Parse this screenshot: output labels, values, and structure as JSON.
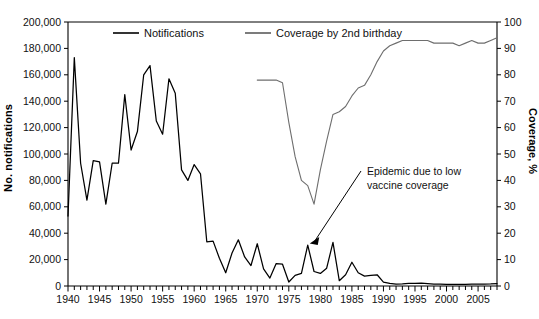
{
  "chart_data": {
    "type": "line",
    "title": "",
    "xlabel": "",
    "ylabel": "No. notifications",
    "y2label": "Coverage, %",
    "xlim": [
      1940,
      2008
    ],
    "ylim": [
      0,
      200000
    ],
    "y2lim": [
      0,
      100
    ],
    "grid": false,
    "legend_position": "top-center",
    "xticks": [
      1940,
      1945,
      1950,
      1955,
      1960,
      1965,
      1970,
      1975,
      1980,
      1985,
      1990,
      1995,
      2000,
      2005
    ],
    "xticklabels": [
      "1940",
      "1945",
      "1950",
      "1955",
      "1960",
      "1965",
      "1970",
      "1975",
      "1980",
      "1985",
      "1990",
      "1995",
      "2000",
      "2005"
    ],
    "yticks": [
      0,
      20000,
      40000,
      60000,
      80000,
      100000,
      120000,
      140000,
      160000,
      180000,
      200000
    ],
    "yticklabels": [
      "0",
      "20,000",
      "40,000",
      "60,000",
      "80,000",
      "100,000",
      "120,000",
      "140,000",
      "160,000",
      "180,000",
      "200,000"
    ],
    "y2ticks": [
      0,
      10,
      20,
      30,
      40,
      50,
      60,
      70,
      80,
      90,
      100
    ],
    "y2ticklabels": [
      "0",
      "10",
      "20",
      "30",
      "40",
      "50",
      "60",
      "70",
      "80",
      "90",
      "100"
    ],
    "minor_xticks_interval": 1,
    "series": [
      {
        "name": "Notifications",
        "axis": "left",
        "color": "#000000",
        "x": [
          1940,
          1941,
          1942,
          1943,
          1944,
          1945,
          1946,
          1947,
          1948,
          1949,
          1950,
          1951,
          1952,
          1953,
          1954,
          1955,
          1956,
          1957,
          1958,
          1959,
          1960,
          1961,
          1962,
          1963,
          1964,
          1965,
          1966,
          1967,
          1968,
          1969,
          1970,
          1971,
          1972,
          1973,
          1974,
          1975,
          1976,
          1977,
          1978,
          1979,
          1980,
          1981,
          1982,
          1983,
          1984,
          1985,
          1986,
          1987,
          1988,
          1989,
          1990,
          1991,
          1992,
          1993,
          1994,
          1995,
          1996,
          1997,
          1998,
          1999,
          2000,
          2001,
          2002,
          2003,
          2004,
          2005,
          2006,
          2007,
          2008
        ],
        "values": [
          53000,
          173000,
          93000,
          65000,
          95000,
          94000,
          62000,
          93000,
          93000,
          145000,
          103000,
          117000,
          160000,
          167000,
          125000,
          115000,
          157000,
          146000,
          88000,
          80000,
          92000,
          85000,
          33500,
          34000,
          21000,
          10000,
          25000,
          35000,
          22000,
          15500,
          32000,
          13000,
          6000,
          17000,
          16500,
          3000,
          8000,
          9500,
          31000,
          11000,
          9500,
          13500,
          33000,
          4000,
          8500,
          18000,
          10000,
          7500,
          8000,
          8500,
          3000,
          2000,
          1500,
          1700,
          2000,
          2000,
          2200,
          1800,
          1500,
          1400,
          1300,
          1200,
          1200,
          1300,
          1400,
          1400,
          1500,
          1600,
          1800
        ]
      },
      {
        "name": "Coverage by 2nd birthday",
        "axis": "right",
        "color": "#6e6e6e",
        "x": [
          1970,
          1971,
          1972,
          1973,
          1974,
          1975,
          1976,
          1977,
          1978,
          1979,
          1980,
          1981,
          1982,
          1983,
          1984,
          1985,
          1986,
          1987,
          1988,
          1989,
          1990,
          1991,
          1992,
          1993,
          1994,
          1995,
          1996,
          1997,
          1998,
          1999,
          2000,
          2001,
          2002,
          2003,
          2004,
          2005,
          2006,
          2007,
          2008
        ],
        "values": [
          78,
          78,
          78,
          78,
          77,
          62,
          49,
          40,
          38,
          31,
          44,
          55,
          65,
          66,
          68,
          72,
          75,
          76,
          80,
          85,
          89,
          91,
          92,
          93,
          93,
          93,
          93,
          93,
          92,
          92,
          92,
          92,
          91,
          92,
          93,
          92,
          92,
          93,
          94
        ]
      }
    ],
    "annotations": [
      {
        "text_lines": [
          "Epidemic due to low",
          "vaccine coverage"
        ],
        "points_to_year": 1978,
        "points_to_value": 31000
      }
    ]
  },
  "legend": {
    "items": [
      {
        "label": "Notifications",
        "color": "#000000"
      },
      {
        "label": "Coverage by 2nd birthday",
        "color": "#6e6e6e"
      }
    ]
  }
}
